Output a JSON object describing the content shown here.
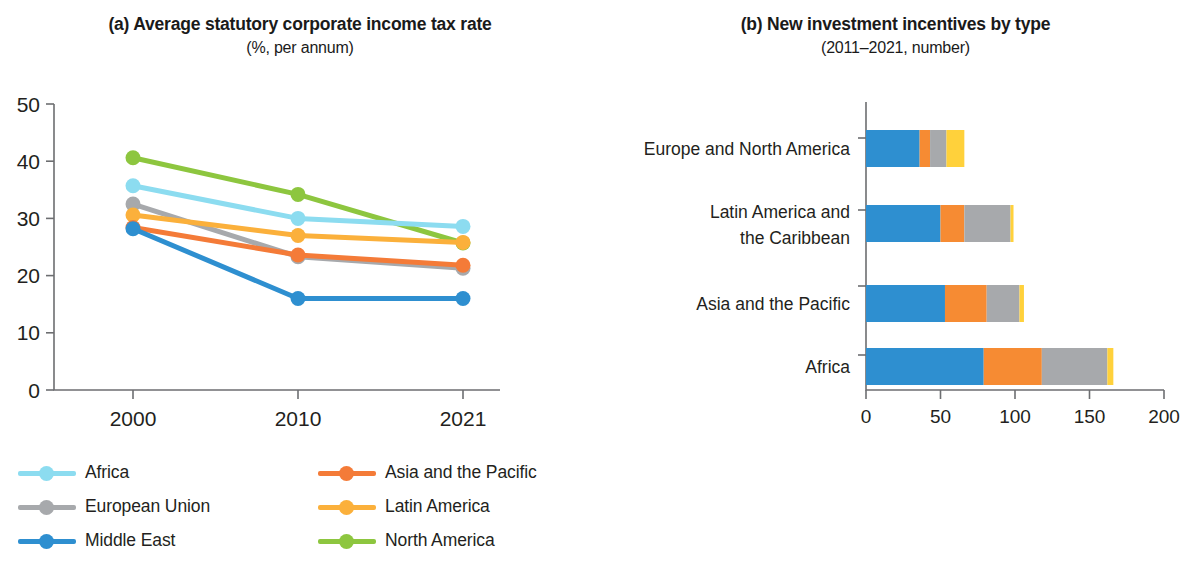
{
  "panel_a": {
    "title": "(a) Average statutory corporate income tax rate",
    "subtitle": "(%, per annum)"
  },
  "panel_b": {
    "title": "(b) New investment incentives by type",
    "subtitle": "(2011–2021, number)"
  },
  "chart_data": [
    {
      "type": "line",
      "title": "(a) Average statutory corporate income tax rate",
      "subtitle": "(%, per annum)",
      "xlabel": "",
      "ylabel": "(%, per annum)",
      "x": [
        "2000",
        "2010",
        "2021"
      ],
      "xtick_labels": [
        "2000",
        "2010",
        "2021"
      ],
      "ytick_labels": [
        "0",
        "10",
        "20",
        "30",
        "40",
        "50"
      ],
      "ylim": [
        0,
        50
      ],
      "grid": false,
      "legend_position": "below",
      "series": [
        {
          "name": "Africa",
          "color": "#8CDCF0",
          "values": [
            35.7,
            30.0,
            28.6
          ]
        },
        {
          "name": "Asia and the Pacific",
          "color": "#F47B38",
          "values": [
            28.4,
            23.6,
            21.8
          ]
        },
        {
          "name": "European Union",
          "color": "#A7A9AC",
          "values": [
            32.5,
            23.3,
            21.3
          ]
        },
        {
          "name": "Latin America",
          "color": "#FBB03B",
          "values": [
            30.6,
            27.0,
            25.8
          ]
        },
        {
          "name": "Middle East",
          "color": "#2E8FD0",
          "values": [
            28.2,
            16.0,
            16.0
          ]
        },
        {
          "name": "North America",
          "color": "#8DC63F",
          "values": [
            40.6,
            34.2,
            25.7
          ]
        }
      ]
    },
    {
      "type": "bar",
      "orientation": "horizontal",
      "stacked": true,
      "title": "(b) New investment incentives by type",
      "subtitle": "(2011–2021, number)",
      "xlabel": "",
      "ylabel": "",
      "categories": [
        "Europe and North America",
        "Latin America and\nthe Caribbean",
        "Asia and the Pacific",
        "Africa"
      ],
      "xtick_labels": [
        "0",
        "50",
        "100",
        "150",
        "200"
      ],
      "xlim": [
        0,
        200
      ],
      "grid": false,
      "legend_position": "below",
      "series": [
        {
          "name": "CIT-based incentives",
          "color": "#2E8FD0",
          "values": [
            36,
            50,
            53,
            79
          ]
        },
        {
          "name": "Indirect taxes/duties",
          "color": "#F68B33",
          "values": [
            7,
            16,
            28,
            39
          ]
        },
        {
          "name": "Other taxes",
          "color": "#A7A9AC",
          "values": [
            11,
            31,
            22,
            44
          ]
        },
        {
          "name": "Financial incentives",
          "color": "#FFD13B",
          "values": [
            12,
            2,
            3,
            4
          ]
        }
      ]
    }
  ],
  "legend_a": {
    "items": [
      {
        "label": "Africa",
        "color": "#8CDCF0"
      },
      {
        "label": "Asia and the Pacific",
        "color": "#F47B38"
      },
      {
        "label": "European Union",
        "color": "#A7A9AC"
      },
      {
        "label": "Latin America",
        "color": "#FBB03B"
      },
      {
        "label": "Middle East",
        "color": "#2E8FD0"
      },
      {
        "label": "North America",
        "color": "#8DC63F"
      }
    ]
  },
  "legend_b": {
    "items": [
      {
        "label": "CIT-based incentives",
        "color": "#2E8FD0"
      },
      {
        "label": "Indirect taxes/duties",
        "color": "#F68B33"
      },
      {
        "label": "Other taxes",
        "color": "#A7A9AC"
      },
      {
        "label": "Financial incentives",
        "color": "#FFD13B"
      }
    ]
  }
}
